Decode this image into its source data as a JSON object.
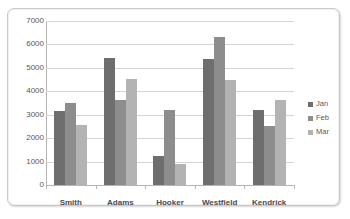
{
  "chart_data": {
    "type": "bar",
    "title": "",
    "xlabel": "",
    "ylabel": "",
    "categories": [
      "Smith",
      "Adams",
      "Hooker",
      "Westfield",
      "Kendrick"
    ],
    "series": [
      {
        "name": "Jan",
        "color": "#6e6e6e",
        "values": [
          3140,
          5430,
          1250,
          5400,
          3200
        ]
      },
      {
        "name": "Feb",
        "color": "#8d8d8d",
        "values": [
          3520,
          3620,
          3200,
          6300,
          2530
        ]
      },
      {
        "name": "Mar",
        "color": "#b3b3b3",
        "values": [
          2550,
          4540,
          880,
          4480,
          3620
        ]
      }
    ],
    "ylim": [
      0,
      7000
    ],
    "y_ticks": [
      0,
      1000,
      2000,
      3000,
      4000,
      5000,
      6000,
      7000
    ],
    "y_tick_labels": [
      "0",
      "1000",
      "2000",
      "3000",
      "4000",
      "5000",
      "6000",
      "7000"
    ],
    "grid": true,
    "legend_position": "right",
    "legend_entries": [
      "Jan",
      "Feb",
      "Mar"
    ]
  }
}
